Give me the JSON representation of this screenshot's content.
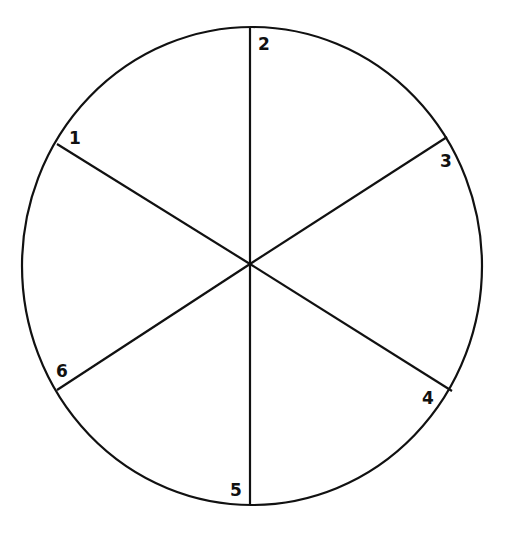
{
  "diagram": {
    "type": "segmented-circle",
    "stroke_color": "#111111",
    "background_color": "#ffffff",
    "circle": {
      "cx": 252,
      "cy": 266,
      "rx": 230,
      "ry": 239
    },
    "center": {
      "x": 250,
      "y": 264
    },
    "spokes": [
      {
        "id": 1,
        "x": 57,
        "y": 144
      },
      {
        "id": 2,
        "x": 250,
        "y": 27
      },
      {
        "id": 3,
        "x": 447,
        "y": 137
      },
      {
        "id": 4,
        "x": 452,
        "y": 391
      },
      {
        "id": 5,
        "x": 250,
        "y": 505
      },
      {
        "id": 6,
        "x": 57,
        "y": 390
      }
    ],
    "labels": [
      {
        "text": "1",
        "x": 69,
        "y": 144
      },
      {
        "text": "2",
        "x": 258,
        "y": 50
      },
      {
        "text": "3",
        "x": 440,
        "y": 167
      },
      {
        "text": "4",
        "x": 422,
        "y": 404
      },
      {
        "text": "5",
        "x": 230,
        "y": 496
      },
      {
        "text": "6",
        "x": 56,
        "y": 377
      }
    ]
  }
}
